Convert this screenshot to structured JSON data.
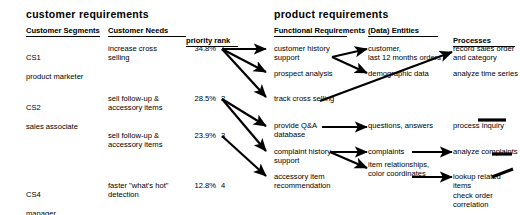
{
  "diagram": {
    "title_left": "customer requirements",
    "title_right": "product requirements",
    "sections": {
      "customer": {
        "headers": [
          {
            "name": "customer-segments",
            "label": "Customer\nSegments",
            "rule_width": 74
          },
          {
            "name": "customer-needs",
            "label": "Customer\nNeeds",
            "rule_width": 78
          },
          {
            "name": "priority-rank",
            "label": "priority rank",
            "rule_width": 52
          }
        ]
      },
      "product": {
        "headers": [
          {
            "name": "functional-requirements",
            "label": "Functional\nRequirements",
            "rule_width": 73
          },
          {
            "name": "data-entities",
            "label": "(Data)\nEntities",
            "rule_width": 70
          },
          {
            "name": "processes",
            "label": "Processes",
            "rule_width": 72
          }
        ]
      }
    },
    "customer_segments": [
      {
        "id": "CS1",
        "code": "CS1",
        "role": "product marketer",
        "y": 47
      },
      {
        "id": "CS2",
        "code": "CS2",
        "role": "sales associate",
        "y": 97
      },
      {
        "id": "CS4",
        "code": "CS4",
        "role": "manager",
        "y": 184
      }
    ],
    "customer_needs": [
      {
        "id": "need1",
        "text": "increase cross\nselling",
        "y": 47,
        "percent": "34.8%",
        "rank": "1"
      },
      {
        "id": "need2",
        "text": "sell follow-up &\naccessory items",
        "y": 97,
        "percent": "28.5%",
        "rank": "2"
      },
      {
        "id": "need3",
        "text": "sell follow-up &\naccessory items",
        "y": 134,
        "percent": "23.9%",
        "rank": "3"
      },
      {
        "id": "need4",
        "text": "faster \"what's hot\"\ndetection",
        "y": 184,
        "percent": "12.8%",
        "rank": "4"
      }
    ],
    "functional_requirements": [
      {
        "id": "fr1",
        "text": "customer history\nsupport",
        "y": 47
      },
      {
        "id": "fr2",
        "text": "prospect analysis",
        "y": 72
      },
      {
        "id": "fr3",
        "text": "track cross selling",
        "y": 97
      },
      {
        "id": "fr4",
        "text": "provide Q&A\ndatabase",
        "y": 124
      },
      {
        "id": "fr5",
        "text": "complaint history\nsupport",
        "y": 150
      },
      {
        "id": "fr6",
        "text": "accessory item\nrecommendation",
        "y": 175
      }
    ],
    "entities": [
      {
        "id": "en1",
        "text": "customer,\nlast 12 months orders",
        "y": 47
      },
      {
        "id": "en2",
        "text": "demographic data",
        "y": 72
      },
      {
        "id": "en3",
        "text": "questions, answers",
        "y": 124
      },
      {
        "id": "en4",
        "text": "complaints",
        "y": 150
      },
      {
        "id": "en5",
        "text": "item relationships,\ncolor coordinates",
        "y": 163
      }
    ],
    "processes": [
      {
        "id": "pr1",
        "text": "record sales order\nand category",
        "y": 47
      },
      {
        "id": "pr2",
        "text": "analyze time series",
        "y": 72
      },
      {
        "id": "pr3",
        "text": "process inquiry",
        "y": 124
      },
      {
        "id": "pr4",
        "text": "analyze complaints",
        "y": 150
      },
      {
        "id": "pr5",
        "text": "lookup related items\ncheck order correlation",
        "y": 175
      }
    ],
    "edges": [
      {
        "name": "edge-rank1-to-customer-history",
        "from": "rank1",
        "to": "fr1"
      },
      {
        "name": "edge-rank1-to-prospect-analysis",
        "from": "rank1",
        "to": "fr2"
      },
      {
        "name": "edge-rank1-to-track-cross-selling",
        "from": "rank1",
        "to": "fr3"
      },
      {
        "name": "edge-rank2-to-provide-qa-database",
        "from": "rank2",
        "to": "fr4"
      },
      {
        "name": "edge-rank2-to-complaint-history",
        "from": "rank2",
        "to": "fr5"
      },
      {
        "name": "edge-rank3-to-accessory-item",
        "from": "rank3",
        "to": "fr6"
      },
      {
        "name": "edge-fr1-to-customer-orders",
        "from": "fr1",
        "to": "en1"
      },
      {
        "name": "edge-fr1-to-demographic-data",
        "from": "fr1",
        "to": "en2"
      },
      {
        "name": "edge-fr3-to-record-sales-order",
        "from": "fr3",
        "to": "pr1"
      },
      {
        "name": "edge-fr4-to-questions-answers",
        "from": "fr4",
        "to": "en3"
      },
      {
        "name": "edge-fr5-to-complaints",
        "from": "fr5",
        "to": "en4"
      },
      {
        "name": "edge-fr5-to-item-relationships",
        "from": "fr5",
        "to": "en5"
      },
      {
        "name": "edge-en4-to-analyze-complaints",
        "from": "en4",
        "to": "pr4"
      },
      {
        "name": "edge-en5-to-lookup-related-items",
        "from": "en5",
        "to": "pr5"
      }
    ],
    "edge_stubs": [
      {
        "name": "stub-process-inquiry",
        "x": 478,
        "y": 119,
        "width": 28,
        "rotate": 0
      },
      {
        "name": "stub-analyze-complaints",
        "x": 492,
        "y": 152,
        "width": 20,
        "rotate": 0
      },
      {
        "name": "stub-lookup-related-items",
        "x": 493,
        "y": 170,
        "width": 22,
        "rotate": -22
      }
    ],
    "colors": {
      "ink": "#000000",
      "background": "#ffffff"
    }
  }
}
